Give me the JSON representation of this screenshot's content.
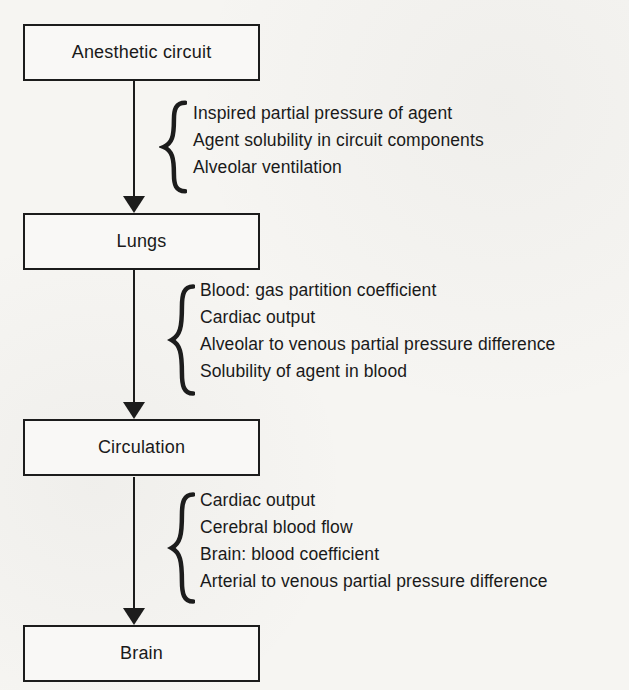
{
  "page": {
    "background": "#f6f5f2",
    "ink": "#1a1a1a"
  },
  "diagram": {
    "type": "flowchart",
    "nodes": [
      {
        "id": "anesthetic-circuit",
        "label": "Anesthetic circuit"
      },
      {
        "id": "lungs",
        "label": "Lungs"
      },
      {
        "id": "circulation",
        "label": "Circulation"
      },
      {
        "id": "brain",
        "label": "Brain"
      }
    ],
    "edges": [
      {
        "from": "anesthetic-circuit",
        "to": "lungs",
        "factors": [
          "Inspired partial pressure of agent",
          "Agent solubility in circuit components",
          "Alveolar ventilation"
        ]
      },
      {
        "from": "lungs",
        "to": "circulation",
        "factors": [
          "Blood: gas partition coefficient",
          "Cardiac output",
          "Alveolar to venous partial pressure difference",
          "Solubility of agent in blood"
        ]
      },
      {
        "from": "circulation",
        "to": "brain",
        "factors": [
          "Cardiac output",
          "Cerebral blood flow",
          "Brain: blood coefficient",
          "Arterial to venous partial pressure difference"
        ]
      }
    ]
  }
}
